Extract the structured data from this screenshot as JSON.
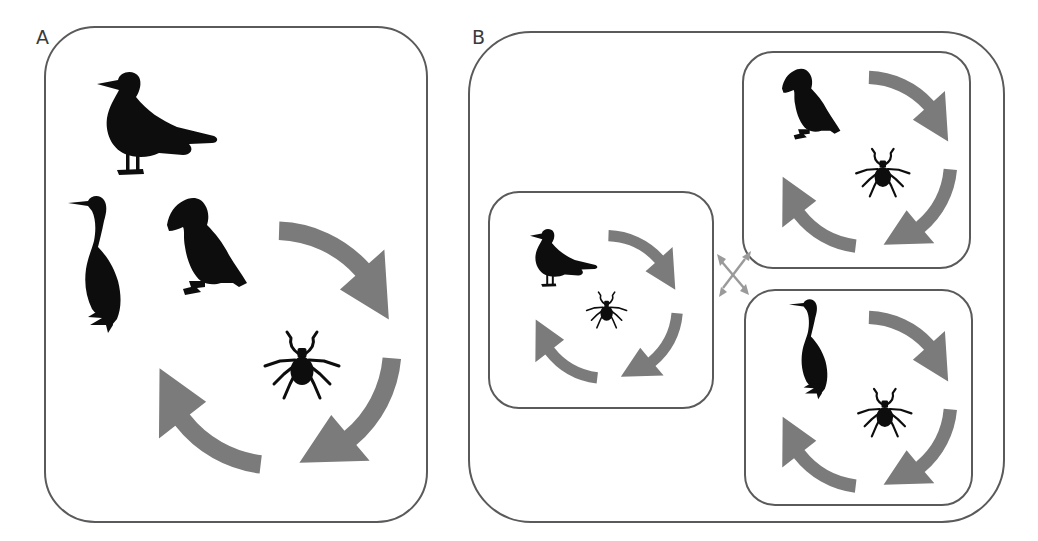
{
  "figure": {
    "colors": {
      "background": "#ffffff",
      "box_stroke": "#5a5a5a",
      "cycle_arrow": "#7b7b7b",
      "silhouette": "#0d0d0d",
      "dispersal_arrow": "#9a9a9a"
    },
    "panel_a": {
      "label": "A",
      "hosts": [
        "gull-icon",
        "shag-icon",
        "puffin-icon"
      ],
      "parasite": "tick-icon",
      "cycle": "transmission-cycle-icon"
    },
    "panel_b": {
      "label": "B",
      "subpopulations": [
        {
          "host": "gull-icon",
          "parasite": "tick-icon",
          "cycle": "transmission-cycle-icon"
        },
        {
          "host": "puffin-icon",
          "parasite": "tick-icon",
          "cycle": "transmission-cycle-icon"
        },
        {
          "host": "shag-icon",
          "parasite": "tick-icon",
          "cycle": "transmission-cycle-icon"
        }
      ],
      "connector": "bidirectional-dispersal-arrows-icon"
    }
  }
}
